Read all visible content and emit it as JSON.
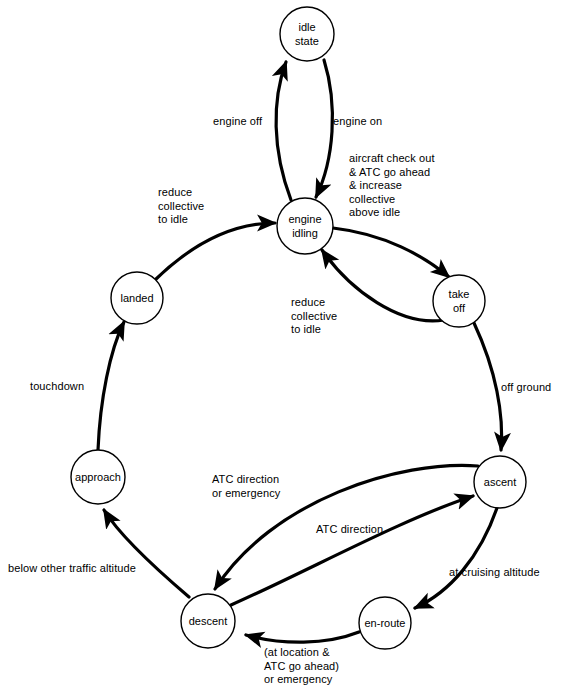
{
  "diagram": {
    "type": "state-machine",
    "colors": {
      "background": "#ffffff",
      "stroke": "#000000",
      "node_fill": "#ffffff",
      "text": "#000000"
    },
    "nodes": [
      {
        "id": "idle-state",
        "label_line1": "idle",
        "label_line2": "state",
        "cx": 307,
        "cy": 34,
        "r": 27
      },
      {
        "id": "engine-idling",
        "label_line1": "engine",
        "label_line2": "idling",
        "cx": 305,
        "cy": 226,
        "r": 28
      },
      {
        "id": "take-off",
        "label_line1": "take",
        "label_line2": "off",
        "cx": 459,
        "cy": 301,
        "r": 26
      },
      {
        "id": "landed",
        "label_line1": "landed",
        "label_line2": "",
        "cx": 137,
        "cy": 298,
        "r": 26
      },
      {
        "id": "ascent",
        "label_line1": "ascent",
        "label_line2": "",
        "cx": 500,
        "cy": 482,
        "r": 26
      },
      {
        "id": "approach",
        "label_line1": "approach",
        "label_line2": "",
        "cx": 98,
        "cy": 477,
        "r": 27
      },
      {
        "id": "descent",
        "label_line1": "descent",
        "label_line2": "",
        "cx": 208,
        "cy": 621,
        "r": 27
      },
      {
        "id": "en-route",
        "label_line1": "en-route",
        "label_line2": "",
        "cx": 385,
        "cy": 623,
        "r": 26
      }
    ],
    "edges": [
      {
        "id": "engine-idling-to-idle-state",
        "from": "engine-idling",
        "to": "idle-state",
        "label": "engine off"
      },
      {
        "id": "idle-state-to-engine-idling",
        "from": "idle-state",
        "to": "engine-idling",
        "label": "engine on"
      },
      {
        "id": "engine-idling-to-take-off",
        "from": "engine-idling",
        "to": "take-off",
        "label": "aircraft check out\n& ATC go ahead\n& increase\ncollective\nabove idle"
      },
      {
        "id": "take-off-to-engine-idling",
        "from": "take-off",
        "to": "engine-idling",
        "label": "reduce\ncollective\nto idle"
      },
      {
        "id": "landed-to-engine-idling",
        "from": "landed",
        "to": "engine-idling",
        "label": "reduce\ncollective\nto idle"
      },
      {
        "id": "take-off-to-ascent",
        "from": "take-off",
        "to": "ascent",
        "label": "off ground"
      },
      {
        "id": "ascent-to-en-route",
        "from": "ascent",
        "to": "en-route",
        "label": "at cruising altitude"
      },
      {
        "id": "en-route-to-descent",
        "from": "en-route",
        "to": "descent",
        "label": "(at location &\nATC go ahead)\nor emergency"
      },
      {
        "id": "ascent-to-descent",
        "from": "ascent",
        "to": "descent",
        "label": "ATC direction\nor emergency"
      },
      {
        "id": "descent-to-ascent",
        "from": "descent",
        "to": "ascent",
        "label": "ATC direction"
      },
      {
        "id": "descent-to-approach",
        "from": "descent",
        "to": "approach",
        "label": "below other traffic altitude"
      },
      {
        "id": "approach-to-landed",
        "from": "approach",
        "to": "landed",
        "label": "touchdown"
      }
    ],
    "labels": {
      "engine_off": "engine off",
      "engine_on": "engine on",
      "aircraft_check_out": "aircraft check out\n& ATC go ahead\n& increase\ncollective\nabove idle",
      "reduce_collective_right": "reduce\ncollective\nto idle",
      "reduce_collective_left": "reduce\ncollective\nto idle",
      "off_ground": "off ground",
      "at_cruising_altitude": "at cruising altitude",
      "at_location_atc": "(at location &\nATC go ahead)\nor emergency",
      "atc_direction_or_emergency": "ATC direction\nor emergency",
      "atc_direction": "ATC direction",
      "below_other_traffic": "below other traffic altitude",
      "touchdown": "touchdown"
    }
  }
}
